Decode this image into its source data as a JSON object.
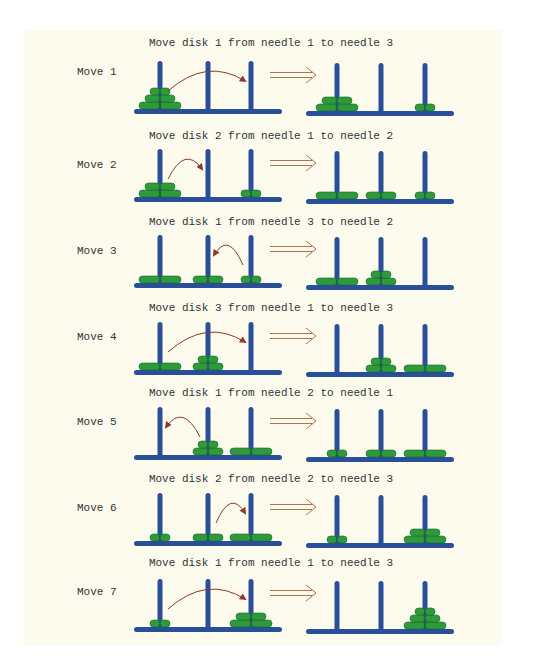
{
  "colors": {
    "background": "#fdfbee",
    "peg": "#2a4f9a",
    "disk": "#2e9a3c",
    "disk_outline": "#166a24",
    "move_arrow": "#8a3b2a",
    "transition_arrow": "#b07050",
    "text": "#333333"
  },
  "layout": {
    "left_board": {
      "x1": 134,
      "x2": 282,
      "pegs": [
        160,
        208,
        251
      ]
    },
    "right_board": {
      "x1": 306,
      "x2": 454,
      "pegs": [
        337,
        381,
        425
      ]
    },
    "disk_widths": {
      "1": 20,
      "2": 30,
      "3": 42
    },
    "disk_height": 7,
    "peg_height": 50
  },
  "moves": [
    {
      "label": "Move 1",
      "caption": "Move disk 1 from needle 1 to needle 3",
      "disk": 1,
      "from": 1,
      "to": 3,
      "caption_y": 46,
      "base_y": 111,
      "before": [
        [
          3,
          2,
          1
        ],
        [],
        []
      ],
      "after": [
        [
          3,
          2
        ],
        [],
        [
          1
        ]
      ]
    },
    {
      "label": "Move 2",
      "caption": "Move disk 2 from needle 1 to needle 2",
      "disk": 2,
      "from": 1,
      "to": 2,
      "caption_y": 139,
      "base_y": 199,
      "before": [
        [
          3,
          2
        ],
        [],
        [
          1
        ]
      ],
      "after": [
        [
          3
        ],
        [
          2
        ],
        [
          1
        ]
      ]
    },
    {
      "label": "Move 3",
      "caption": "Move disk 1 from needle 3 to needle 2",
      "disk": 1,
      "from": 3,
      "to": 2,
      "caption_y": 225,
      "base_y": 285,
      "before": [
        [
          3
        ],
        [
          2
        ],
        [
          1
        ]
      ],
      "after": [
        [
          3
        ],
        [
          2,
          1
        ],
        []
      ]
    },
    {
      "label": "Move 4",
      "caption": "Move disk 3 from needle 1 to needle 3",
      "disk": 3,
      "from": 1,
      "to": 3,
      "caption_y": 311,
      "base_y": 372,
      "before": [
        [
          3
        ],
        [
          2,
          1
        ],
        []
      ],
      "after": [
        [],
        [
          2,
          1
        ],
        [
          3
        ]
      ]
    },
    {
      "label": "Move 5",
      "caption": "Move disk 1 from needle 2 to needle 1",
      "disk": 1,
      "from": 2,
      "to": 1,
      "caption_y": 396,
      "base_y": 457,
      "before": [
        [],
        [
          2,
          1
        ],
        [
          3
        ]
      ],
      "after": [
        [
          1
        ],
        [
          2
        ],
        [
          3
        ]
      ]
    },
    {
      "label": "Move 6",
      "caption": "Move disk 2 from needle 2 to needle 3",
      "disk": 2,
      "from": 2,
      "to": 3,
      "caption_y": 482,
      "base_y": 543,
      "before": [
        [
          1
        ],
        [
          2
        ],
        [
          3
        ]
      ],
      "after": [
        [
          1
        ],
        [],
        [
          3,
          2
        ]
      ]
    },
    {
      "label": "Move 7",
      "caption": "Move disk 1 from needle 1 to needle 3",
      "disk": 1,
      "from": 1,
      "to": 3,
      "caption_y": 566,
      "base_y": 629,
      "before": [
        [
          1
        ],
        [],
        [
          3,
          2
        ]
      ],
      "after": [
        [],
        [],
        [
          3,
          2,
          1
        ]
      ]
    }
  ]
}
